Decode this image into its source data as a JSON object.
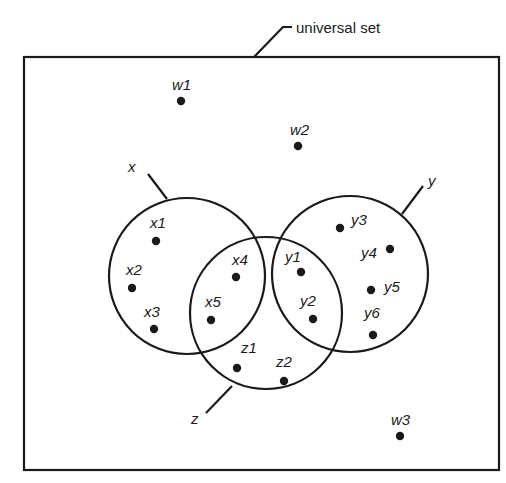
{
  "diagram": {
    "type": "venn",
    "universe": {
      "label": "universal set",
      "box": {
        "x": 24,
        "y": 57,
        "width": 475,
        "height": 413
      },
      "callout": {
        "points": [
          [
            254,
            57
          ],
          [
            283,
            27
          ],
          [
            292,
            27
          ]
        ],
        "label_pos": [
          296,
          33
        ]
      }
    },
    "sets": [
      {
        "id": "x",
        "label": "x",
        "cx": 187,
        "cy": 276,
        "r": 78,
        "leader": [
          [
            167,
            199
          ],
          [
            148,
            174
          ]
        ],
        "label_pos": [
          128,
          172
        ]
      },
      {
        "id": "y",
        "label": "y",
        "cx": 350,
        "cy": 274,
        "r": 78,
        "leader": [
          [
            402,
            214
          ],
          [
            423,
            186
          ]
        ],
        "label_pos": [
          428,
          186
        ]
      },
      {
        "id": "z",
        "label": "z",
        "cx": 266,
        "cy": 313,
        "r": 76,
        "leader": [
          [
            232,
            386
          ],
          [
            206,
            413
          ]
        ],
        "label_pos": [
          191,
          424
        ]
      }
    ],
    "elements": [
      {
        "label": "w1",
        "x": 181,
        "y": 101,
        "lx": 172,
        "ly": 90,
        "region": "universe only"
      },
      {
        "label": "w2",
        "x": 298,
        "y": 146,
        "lx": 290,
        "ly": 135,
        "region": "universe only"
      },
      {
        "label": "w3",
        "x": 400,
        "y": 436,
        "lx": 391,
        "ly": 425,
        "region": "universe only"
      },
      {
        "label": "x1",
        "x": 156,
        "y": 241,
        "lx": 150,
        "ly": 228,
        "region": "x only"
      },
      {
        "label": "x2",
        "x": 132,
        "y": 288,
        "lx": 126,
        "ly": 275,
        "region": "x only"
      },
      {
        "label": "x3",
        "x": 154,
        "y": 329,
        "lx": 144,
        "ly": 317,
        "region": "x only"
      },
      {
        "label": "x4",
        "x": 236,
        "y": 277,
        "lx": 232,
        "ly": 265,
        "region": "x and z"
      },
      {
        "label": "x5",
        "x": 211,
        "y": 320,
        "lx": 205,
        "ly": 307,
        "region": "x and z"
      },
      {
        "label": "y1",
        "x": 301,
        "y": 272,
        "lx": 285,
        "ly": 262,
        "region": "y and z"
      },
      {
        "label": "y2",
        "x": 313,
        "y": 319,
        "lx": 300,
        "ly": 306,
        "region": "y and z"
      },
      {
        "label": "y3",
        "x": 340,
        "y": 228,
        "lx": 351,
        "ly": 225,
        "region": "y only"
      },
      {
        "label": "y4",
        "x": 390,
        "y": 249,
        "lx": 361,
        "ly": 258,
        "region": "y only"
      },
      {
        "label": "y5",
        "x": 371,
        "y": 290,
        "lx": 384,
        "ly": 292,
        "region": "y only"
      },
      {
        "label": "y6",
        "x": 373,
        "y": 335,
        "lx": 364,
        "ly": 318,
        "region": "y only"
      },
      {
        "label": "z1",
        "x": 237,
        "y": 368,
        "lx": 241,
        "ly": 353,
        "region": "z only"
      },
      {
        "label": "z2",
        "x": 284,
        "y": 381,
        "lx": 276,
        "ly": 367,
        "region": "z only"
      }
    ]
  },
  "style": {
    "ink": "#1a1a1a",
    "background": "#ffffff",
    "dot_radius": 4.2,
    "stroke_width": 2.2
  }
}
